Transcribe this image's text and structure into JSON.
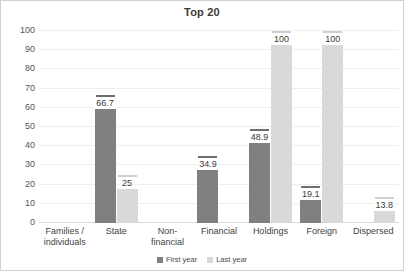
{
  "chart_data": {
    "type": "bar",
    "title": "Top 20",
    "xlabel": "",
    "ylabel": "",
    "ylim": [
      0,
      100
    ],
    "yticks": [
      0,
      10,
      20,
      30,
      40,
      50,
      60,
      70,
      80,
      90,
      100
    ],
    "grid": true,
    "legend_position": "bottom-center",
    "categories": [
      "Families /\nindividuals",
      "State",
      "Non-financial",
      "Financial",
      "Holdings",
      "Foreign",
      "Dispersed"
    ],
    "series": [
      {
        "name": "First year",
        "color": "#808080",
        "values": [
          null,
          66.7,
          null,
          34.9,
          48.9,
          19.1,
          null
        ],
        "labels": [
          "",
          "66.7",
          "",
          "34.9",
          "48.9",
          "19.1",
          ""
        ]
      },
      {
        "name": "Last year",
        "color": "#d9d9d9",
        "values": [
          null,
          25,
          null,
          null,
          100,
          100,
          13.8
        ],
        "labels": [
          "",
          "25",
          "",
          "",
          "100",
          "100",
          "13.8"
        ]
      }
    ]
  },
  "axis": {
    "ytick_labels": [
      "100",
      "90",
      "80",
      "70",
      "60",
      "50",
      "40",
      "30",
      "20",
      "10",
      "0"
    ],
    "category_labels": [
      [
        "Families /",
        "individuals"
      ],
      [
        "State"
      ],
      [
        "Non-financial"
      ],
      [
        "Financial"
      ],
      [
        "Holdings"
      ],
      [
        "Foreign"
      ],
      [
        "Dispersed"
      ]
    ]
  },
  "legend": {
    "items": [
      {
        "label": "First year",
        "color": "#808080"
      },
      {
        "label": "Last year",
        "color": "#d9d9d9"
      }
    ]
  },
  "colors": {
    "first_year": "#808080",
    "last_year": "#d9d9d9",
    "gridline": "#ededf2",
    "baseline": "#d8d8dd",
    "text": "#3f3f3f",
    "background": "#ffffff"
  }
}
